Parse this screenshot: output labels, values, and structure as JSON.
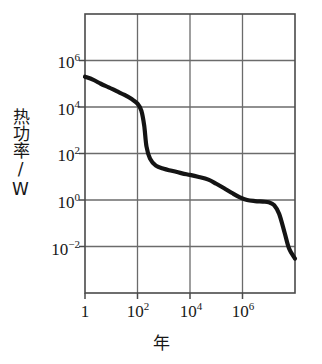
{
  "chart_data": {
    "type": "line",
    "title": "",
    "xlabel": "年",
    "ylabel": "热功率/W",
    "xscale": "log",
    "yscale": "log",
    "xlim": [
      1,
      100000000
    ],
    "ylim": [
      0.0001,
      100000000
    ],
    "grid": true,
    "legend": null,
    "xticks": [
      {
        "value": 1,
        "label_mantissa": "1",
        "label_exponent": ""
      },
      {
        "value": 100,
        "label_mantissa": "10",
        "label_exponent": "2"
      },
      {
        "value": 10000,
        "label_mantissa": "10",
        "label_exponent": "4"
      },
      {
        "value": 1000000,
        "label_mantissa": "10",
        "label_exponent": "6"
      }
    ],
    "yticks": [
      {
        "value": 1000000,
        "label_mantissa": "10",
        "label_exponent": "6"
      },
      {
        "value": 10000,
        "label_mantissa": "10",
        "label_exponent": "4"
      },
      {
        "value": 100,
        "label_mantissa": "10",
        "label_exponent": "2"
      },
      {
        "value": 1,
        "label_mantissa": "10",
        "label_exponent": "0"
      },
      {
        "value": 0.01,
        "label_mantissa": "10",
        "label_exponent": "−2"
      }
    ],
    "series": [
      {
        "name": "decay heat power",
        "color": "#141414",
        "x": [
          1,
          2,
          4,
          8,
          16,
          32,
          60,
          100,
          140,
          180,
          220,
          300,
          500,
          1000,
          2000,
          5000,
          10000,
          20000,
          50000,
          100000,
          200000,
          400000,
          800000,
          1500000,
          3000000,
          6000000,
          10000000,
          16000000,
          25000000,
          40000000,
          60000000,
          100000000
        ],
        "y": [
          200000,
          150000,
          100000,
          70000,
          48000,
          33000,
          22000,
          14000,
          7000,
          1600,
          200,
          60,
          30,
          22,
          18,
          14,
          12,
          10,
          7.5,
          5,
          3.2,
          2.0,
          1.3,
          1.0,
          0.9,
          0.85,
          0.8,
          0.6,
          0.25,
          0.04,
          0.008,
          0.003
        ]
      }
    ]
  },
  "axes": {
    "plot_left_px": 85,
    "plot_right_px": 295,
    "plot_top_px": 14,
    "plot_bottom_px": 293,
    "frame_color": "#4a4a4a",
    "grid_color": "#6b6b6b"
  }
}
